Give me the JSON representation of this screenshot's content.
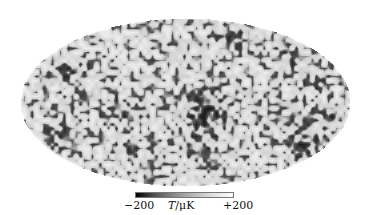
{
  "figure": {
    "type": "mollweide_sky_map",
    "colorbar": {
      "min_label": "−200",
      "max_label": "+200",
      "unit_label": "T/μK",
      "unit_symbol": "T",
      "unit_rest": "/μK",
      "colormap": "grayscale (black = low, white = high)"
    },
    "colors": {
      "background": "#ffffff",
      "map_base": "#dcdcdc",
      "cold_spot": "#1a1a1a"
    }
  }
}
